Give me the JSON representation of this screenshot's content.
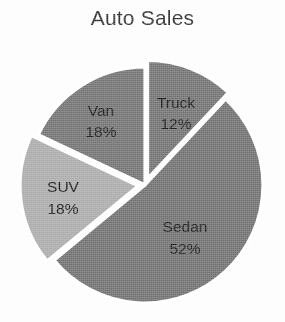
{
  "chart_data": {
    "type": "pie",
    "title": "Auto Sales",
    "xlabel": "",
    "ylabel": "",
    "legend": "none",
    "grid": false,
    "labels_inside": true,
    "categories": [
      "Truck",
      "Sedan",
      "SUV",
      "Van"
    ],
    "values": [
      12,
      52,
      18,
      18
    ],
    "value_unit": "%",
    "slices": [
      {
        "name": "Truck",
        "label": "Truck",
        "value": 12,
        "value_text": "12%",
        "color": "#6f6f6f",
        "exploded": true,
        "start_angle_deg": 0,
        "end_angle_deg": 43.2,
        "label_x": 176,
        "label_y": 104,
        "pct_x": 176,
        "pct_y": 125
      },
      {
        "name": "Sedan",
        "label": "Sedan",
        "value": 52,
        "value_text": "52%",
        "color": "#6d6d6d",
        "exploded": false,
        "start_angle_deg": 43.2,
        "end_angle_deg": 230.4,
        "label_x": 185,
        "label_y": 228,
        "pct_x": 185,
        "pct_y": 250
      },
      {
        "name": "SUV",
        "label": "SUV",
        "value": 18,
        "value_text": "18%",
        "color": "#a9a9a9",
        "exploded": true,
        "start_angle_deg": 230.4,
        "end_angle_deg": 295.2,
        "label_x": 63,
        "label_y": 188,
        "pct_x": 63,
        "pct_y": 210
      },
      {
        "name": "Van",
        "label": "Van",
        "value": 18,
        "value_text": "18%",
        "color": "#707070",
        "exploded": false,
        "start_angle_deg": 295.2,
        "end_angle_deg": 360,
        "label_x": 101,
        "label_y": 112,
        "pct_x": 101,
        "pct_y": 133
      }
    ],
    "geometry": {
      "center_x": 145,
      "center_y": 185,
      "radius": 118,
      "separator_color": "#ffffff",
      "separator_width": 3.2,
      "explode_offset": 7,
      "background": "#ffffff"
    },
    "title_color": "#2b2b2b"
  }
}
